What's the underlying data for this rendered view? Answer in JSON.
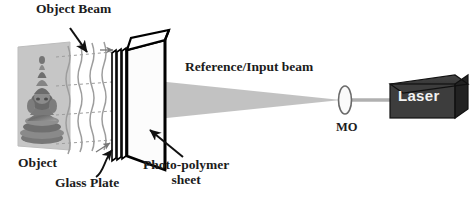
{
  "figure": {
    "kind": "optical-holography-setup-diagram",
    "background_color": "#ffffff"
  },
  "labels": {
    "object_beam": "Object Beam",
    "reference_beam": "Reference/Input beam",
    "mo": "MO",
    "object": "Object",
    "glass_plate": "Glass Plate",
    "photo_polymer_line1": "Photo-polymer",
    "photo_polymer_line2": "sheet",
    "laser": "Laser"
  },
  "components": {
    "laser_box": {
      "label": "Laser",
      "body_color": "#3b3b3b",
      "top_color": "#2e2e2e",
      "side_color": "#1f1f1f",
      "text_color": "#f2f2f2"
    },
    "mo_lens": {
      "label": "MO",
      "shape": "biconvex-lens-ellipse",
      "stroke_color": "#6a6a6a"
    },
    "reference_beam_cone": {
      "fill_color": "#b9b9b9",
      "direction": "right-to-left-diverging"
    },
    "plate_stack": {
      "description": "glass plate + photo-polymer sheet assembly",
      "outline_color": "#000000",
      "face_color": "#fdfdfd"
    },
    "object_photo": {
      "description": "statue on light gray backdrop",
      "backdrop_color": "#c9c9c9"
    },
    "object_beam_rays": {
      "style": "wavy-vertical-lines-with-dashed-horizontals",
      "color": "#9a9a9a"
    }
  },
  "icons": {
    "object_beam_arrow": "arrow-down-right-icon",
    "glass_plate_leader": "curved-leader-arrow-icon",
    "photo_polymer_leader": "straight-leader-arrow-icon",
    "small_plate_arrow_top": "arrow-right-icon",
    "small_plate_arrow_bottom": "arrow-up-right-icon"
  }
}
